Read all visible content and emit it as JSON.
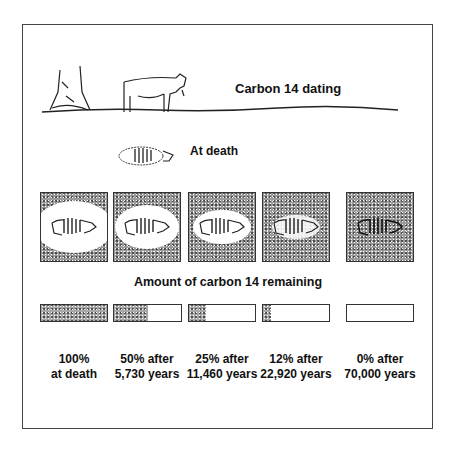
{
  "title": "Carbon 14 dating",
  "at_death_label": "At death",
  "amount_heading": "Amount of carbon 14 remaining",
  "stages": [
    {
      "percent": 100,
      "line1": "100%",
      "line2": "at death",
      "halo": 1.0
    },
    {
      "percent": 50,
      "line1": "50% after",
      "line2": "5,730 years",
      "halo": 0.8
    },
    {
      "percent": 25,
      "line1": "25% after",
      "line2": "11,460 years",
      "halo": 0.55
    },
    {
      "percent": 12,
      "line1": "12% after",
      "line2": "22,920 years",
      "halo": 0.3
    },
    {
      "percent": 0,
      "line1": "0% after",
      "line2": "70,000 years",
      "halo": 0
    }
  ],
  "colors": {
    "ink": "#111111",
    "frame": "#444444",
    "stipple": "#9a9a9a"
  }
}
